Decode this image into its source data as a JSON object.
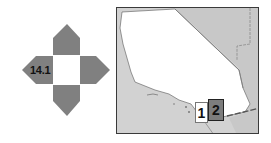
{
  "navigator": {
    "current_page_label": "14.1",
    "directions": [
      "up",
      "right",
      "down",
      "left"
    ],
    "arrow_color": "#808080"
  },
  "locator_map": {
    "land_color": "#ffffff",
    "neighbor_color": "#d2d2d2",
    "frame_color": "#3a3a3a",
    "tiles": [
      {
        "label": "1",
        "state": "current",
        "fill": "#ffffff"
      },
      {
        "label": "2",
        "state": "adjacent",
        "fill": "#7d7d7d"
      }
    ]
  }
}
